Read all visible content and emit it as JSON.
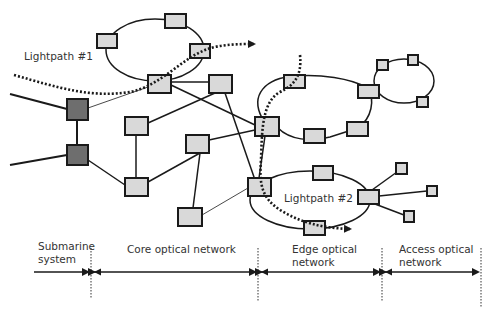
{
  "colors": {
    "node_fill": "#d9d9d9",
    "node_dark_fill": "#6e6e6e",
    "stroke": "#1a1a1a",
    "text": "#333333"
  },
  "labels": {
    "lightpath1": "Lightpath #1",
    "lightpath2": "Lightpath #2"
  },
  "segments": [
    {
      "id": "submarine",
      "line1": "Submarine",
      "line2": "system"
    },
    {
      "id": "core",
      "line1": "Core optical network",
      "line2": ""
    },
    {
      "id": "edge",
      "line1": "Edge optical",
      "line2": "network"
    },
    {
      "id": "access",
      "line1": "Access optical",
      "line2": "network"
    }
  ],
  "nodes": {
    "dark": [
      {
        "x": 67,
        "y": 99,
        "w": 21,
        "h": 21
      },
      {
        "x": 67,
        "y": 145,
        "w": 21,
        "h": 20
      }
    ],
    "light": [
      {
        "x": 97,
        "y": 34,
        "w": 20,
        "h": 14
      },
      {
        "x": 165,
        "y": 14,
        "w": 21,
        "h": 14
      },
      {
        "x": 190,
        "y": 44,
        "w": 20,
        "h": 14
      },
      {
        "x": 148,
        "y": 75,
        "w": 23,
        "h": 18
      },
      {
        "x": 209,
        "y": 75,
        "w": 23,
        "h": 18
      },
      {
        "x": 125,
        "y": 117,
        "w": 23,
        "h": 18
      },
      {
        "x": 186,
        "y": 135,
        "w": 23,
        "h": 18
      },
      {
        "x": 125,
        "y": 178,
        "w": 23,
        "h": 18
      },
      {
        "x": 178,
        "y": 208,
        "w": 24,
        "h": 18
      },
      {
        "x": 284,
        "y": 75,
        "w": 21,
        "h": 13
      },
      {
        "x": 358,
        "y": 85,
        "w": 21,
        "h": 13
      },
      {
        "x": 255,
        "y": 117,
        "w": 24,
        "h": 19
      },
      {
        "x": 304,
        "y": 129,
        "w": 21,
        "h": 14
      },
      {
        "x": 347,
        "y": 122,
        "w": 21,
        "h": 14
      },
      {
        "x": 377,
        "y": 60,
        "w": 11,
        "h": 10
      },
      {
        "x": 408,
        "y": 55,
        "w": 10,
        "h": 10
      },
      {
        "x": 417,
        "y": 97,
        "w": 11,
        "h": 10
      },
      {
        "x": 248,
        "y": 178,
        "w": 23,
        "h": 18
      },
      {
        "x": 313,
        "y": 166,
        "w": 20,
        "h": 14
      },
      {
        "x": 358,
        "y": 190,
        "w": 21,
        "h": 14
      },
      {
        "x": 304,
        "y": 221,
        "w": 21,
        "h": 14
      },
      {
        "x": 396,
        "y": 163,
        "w": 11,
        "h": 11
      },
      {
        "x": 427,
        "y": 186,
        "w": 10,
        "h": 10
      },
      {
        "x": 404,
        "y": 211,
        "w": 10,
        "h": 11
      }
    ]
  }
}
